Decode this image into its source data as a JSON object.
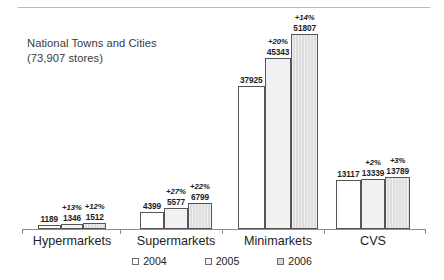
{
  "chart_data": {
    "type": "bar",
    "title": "National Towns and Cities",
    "subtitle": "(73,907 stores)",
    "xlabel": "",
    "ylabel": "",
    "ylim": [
      0,
      57000
    ],
    "grid": false,
    "legend_position": "bottom",
    "categories": [
      "Hypermarkets",
      "Supermarkets",
      "Minimarkets",
      "CVS"
    ],
    "series": [
      {
        "name": "2004",
        "values": [
          1189,
          4399,
          37925,
          13117
        ]
      },
      {
        "name": "2005",
        "values": [
          1346,
          5577,
          45343,
          13339
        ]
      },
      {
        "name": "2006",
        "values": [
          1512,
          6799,
          51807,
          13789
        ]
      }
    ],
    "annotations": {
      "Hypermarkets": [
        "",
        "+13%",
        "+12%"
      ],
      "Supermarkets": [
        "",
        "+27%",
        "+22%"
      ],
      "Minimarkets": [
        "",
        "+20%",
        "+14%"
      ],
      "CVS": [
        "",
        "+2%",
        "+3%"
      ]
    }
  },
  "title": {
    "line1": "National Towns and Cities",
    "line2": "(73,907 stores)"
  },
  "legend": {
    "items": [
      {
        "label": "2004",
        "swatch": "#ffffff"
      },
      {
        "label": "2005",
        "swatch": "#f1f1f1"
      },
      {
        "label": "2006",
        "swatch": "#d8d8d8"
      }
    ]
  },
  "colors": {
    "y2004": "#ffffff",
    "y2005": "#f1f1f1",
    "y2006": "#d8d8d8",
    "bar_outline": "#555555",
    "axis": "#8d8d8d",
    "text": "#1d1d1d"
  }
}
